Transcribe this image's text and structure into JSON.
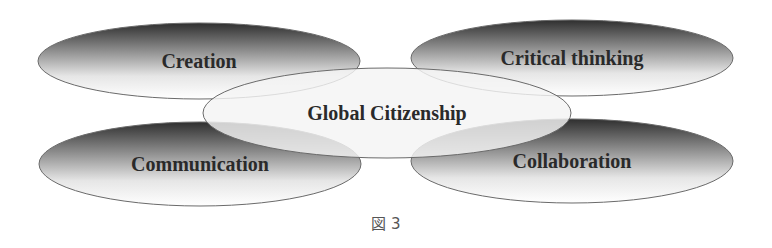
{
  "diagram": {
    "center": {
      "label": "Global Citizenship"
    },
    "nodes": [
      {
        "id": "creation",
        "label": "Creation"
      },
      {
        "id": "critical-thinking",
        "label": "Critical thinking"
      },
      {
        "id": "communication",
        "label": "Communication"
      },
      {
        "id": "collaboration",
        "label": "Collaboration"
      }
    ]
  },
  "caption": "図 3",
  "colors": {
    "dark": "#2f2f2f",
    "light": "#ffffff",
    "stroke": "#6a6a6a",
    "center_fill": "#f4f4f4"
  }
}
